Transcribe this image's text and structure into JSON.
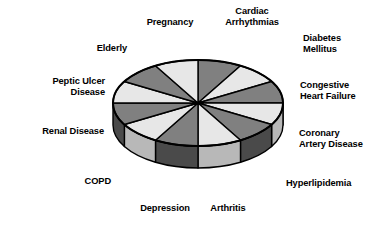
{
  "figure": {
    "background_color": "#ffffff",
    "title": "",
    "outline_color": "#000000"
  },
  "palette": {
    "light_top": "#e7e7e7",
    "dark_top": "#808080",
    "light_side": "#b8b8b8",
    "dark_side": "#4a4a4a",
    "outline": "#000000"
  },
  "chart_data": {
    "type": "pie",
    "title": "",
    "subtitle": "",
    "xlabel": "",
    "ylabel": "",
    "legend_position": "radial-outside-labels",
    "grid": false,
    "three_d": true,
    "equal_slices": true,
    "slice_count": 12,
    "labels": [
      "Cardiac\nArrhythmias",
      "Diabetes\nMellitus",
      "Congestive\nHeart Failure",
      "Coronary\nArtery Disease",
      "Hyperlipidemia",
      "Arthritis",
      "Depression",
      "COPD",
      "Renal Disease",
      "Peptic Ulcer\nDisease",
      "Elderly",
      "Pregnancy"
    ],
    "values": [
      8.33,
      8.33,
      8.33,
      8.33,
      8.33,
      8.33,
      8.33,
      8.33,
      8.33,
      8.33,
      8.33,
      8.33
    ],
    "slice_shades": [
      "dark",
      "light",
      "dark",
      "light",
      "dark",
      "light",
      "dark",
      "light",
      "dark",
      "light",
      "dark",
      "light"
    ]
  },
  "labels": [
    {
      "id": "cardiac-arrhythmias",
      "text": "Cardiac\nArrhythmias",
      "x": 252,
      "y": 6,
      "align": "c"
    },
    {
      "id": "diabetes-mellitus",
      "text": "Diabetes\nMellitus",
      "x": 303,
      "y": 33,
      "align": "l"
    },
    {
      "id": "congestive-heart-failure",
      "text": "Congestive\nHeart Failure",
      "x": 300,
      "y": 80,
      "align": "l"
    },
    {
      "id": "coronary-artery-disease",
      "text": "Coronary\nArtery Disease",
      "x": 299,
      "y": 128,
      "align": "l"
    },
    {
      "id": "hyperlipidemia",
      "text": "Hyperlipidemia",
      "x": 286,
      "y": 178,
      "align": "l"
    },
    {
      "id": "arthritis",
      "text": "Arthritis",
      "x": 228,
      "y": 203,
      "align": "c"
    },
    {
      "id": "depression",
      "text": "Depression",
      "x": 165,
      "y": 203,
      "align": "c"
    },
    {
      "id": "copd",
      "text": "COPD",
      "x": 111,
      "y": 176,
      "align": "r"
    },
    {
      "id": "renal-disease",
      "text": "Renal Disease",
      "x": 104,
      "y": 126,
      "align": "r"
    },
    {
      "id": "peptic-ulcer-disease",
      "text": "Peptic Ulcer\nDisease",
      "x": 105,
      "y": 76,
      "align": "r"
    },
    {
      "id": "elderly",
      "text": "Elderly",
      "x": 127,
      "y": 43,
      "align": "r"
    },
    {
      "id": "pregnancy",
      "text": "Pregnancy",
      "x": 170,
      "y": 17,
      "align": "c"
    }
  ],
  "geometry": {
    "center_x": 198,
    "center_y": 103,
    "radius_x": 85,
    "radius_y": 43,
    "depth": 22,
    "start_angle_deg": -90
  }
}
